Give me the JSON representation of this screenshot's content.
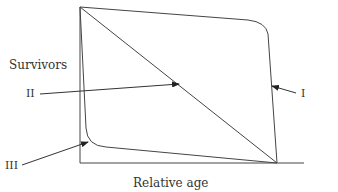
{
  "diagram": {
    "type": "survivorship-curves",
    "y_axis_label": "Survivors",
    "x_axis_label": "Relative age",
    "curves": [
      {
        "id": "I",
        "label": "I",
        "shape": "convex - high survival until late life then sharp drop"
      },
      {
        "id": "II",
        "label": "II",
        "shape": "straight diagonal - constant mortality"
      },
      {
        "id": "III",
        "label": "III",
        "shape": "concave - steep early drop then flat"
      }
    ],
    "colors": {
      "line": "#333333",
      "text": "#333333",
      "background": "#ffffff"
    }
  }
}
